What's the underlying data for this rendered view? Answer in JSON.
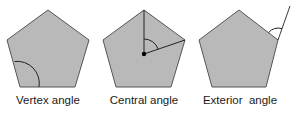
{
  "figure": {
    "background": "#ffffff",
    "fill_color": "#b9b9b9",
    "stroke_color": "#555555",
    "line_color": "#222222",
    "panels": [
      {
        "id": "vertex",
        "label": "Vertex angle",
        "pentagon": [
          [
            48,
            10
          ],
          [
            89,
            40
          ],
          [
            75,
            87
          ],
          [
            20,
            87
          ],
          [
            7,
            40
          ]
        ],
        "marker": "arc at bottom-left vertex between left edge and bottom edge"
      },
      {
        "id": "central",
        "label": "Central angle",
        "pentagon": [
          [
            144,
            10
          ],
          [
            185,
            40
          ],
          [
            171,
            87
          ],
          [
            116,
            87
          ],
          [
            103,
            40
          ]
        ],
        "center": [
          144,
          54
        ],
        "marker": "two radii from center to top and right vertices with arc between them"
      },
      {
        "id": "exterior",
        "label": "Exterior  angle",
        "pentagon": [
          [
            239,
            10
          ],
          [
            278,
            40
          ],
          [
            266,
            87
          ],
          [
            212,
            87
          ],
          [
            199,
            40
          ]
        ],
        "marker": "extension of right edge beyond right vertex with arc between extension and top-right edge"
      }
    ]
  }
}
